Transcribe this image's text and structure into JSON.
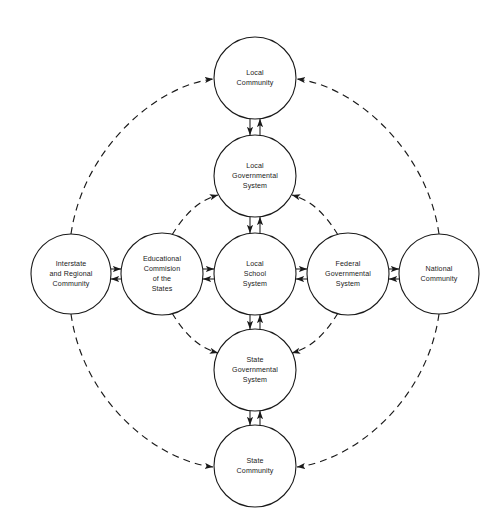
{
  "figure": {
    "type": "node-link-diagram",
    "background_color": "#ffffff",
    "stroke_color": "#1a1a1a",
    "width": 499,
    "height": 530
  },
  "nodes": [
    {
      "id": "local-community",
      "lines": [
        "Local",
        "Community"
      ],
      "cx": 255,
      "cy": 78,
      "r": 41
    },
    {
      "id": "local-governmental-system",
      "lines": [
        "Local",
        "Governmental",
        "System"
      ],
      "cx": 255,
      "cy": 176,
      "r": 41
    },
    {
      "id": "interstate-and-regional-community",
      "lines": [
        "Interstate",
        "and Regional",
        "Community"
      ],
      "cx": 71,
      "cy": 274,
      "r": 40
    },
    {
      "id": "educational-commision-of-the-states",
      "lines": [
        "Educational",
        "Commision",
        "of the",
        "States"
      ],
      "cx": 162,
      "cy": 274,
      "r": 41
    },
    {
      "id": "local-school-system",
      "lines": [
        "Local",
        "School",
        "System"
      ],
      "cx": 255,
      "cy": 274,
      "r": 41
    },
    {
      "id": "federal-governmental-system",
      "lines": [
        "Federal",
        "Governmental",
        "System"
      ],
      "cx": 348,
      "cy": 274,
      "r": 41
    },
    {
      "id": "national-community",
      "lines": [
        "National",
        "Community"
      ],
      "cx": 439,
      "cy": 274,
      "r": 40
    },
    {
      "id": "state-governmental-system",
      "lines": [
        "State",
        "Governmental",
        "System"
      ],
      "cx": 255,
      "cy": 370,
      "r": 41
    },
    {
      "id": "state-community",
      "lines": [
        "State",
        "Community"
      ],
      "cx": 255,
      "cy": 466,
      "r": 41
    }
  ],
  "solid_links": [
    {
      "id": "link-local-community-local-governmental-system",
      "from": "local-community",
      "to": "local-governmental-system",
      "style": "double-arrow-bidirectional",
      "orientation": "vertical"
    },
    {
      "id": "link-local-governmental-system-local-school-system",
      "from": "local-governmental-system",
      "to": "local-school-system",
      "style": "double-arrow-bidirectional",
      "orientation": "vertical"
    },
    {
      "id": "link-local-school-system-state-governmental-system",
      "from": "local-school-system",
      "to": "state-governmental-system",
      "style": "double-arrow-bidirectional",
      "orientation": "vertical"
    },
    {
      "id": "link-state-governmental-system-state-community",
      "from": "state-governmental-system",
      "to": "state-community",
      "style": "double-arrow-bidirectional",
      "orientation": "vertical"
    },
    {
      "id": "link-interstate-educational-commision",
      "from": "interstate-and-regional-community",
      "to": "educational-commision-of-the-states",
      "style": "double-arrow-bidirectional",
      "orientation": "horizontal"
    },
    {
      "id": "link-educational-commision-local-school-system",
      "from": "educational-commision-of-the-states",
      "to": "local-school-system",
      "style": "double-arrow-bidirectional",
      "orientation": "horizontal"
    },
    {
      "id": "link-local-school-system-federal-governmental-system",
      "from": "local-school-system",
      "to": "federal-governmental-system",
      "style": "double-arrow-bidirectional",
      "orientation": "horizontal"
    },
    {
      "id": "link-federal-governmental-system-national-community",
      "from": "federal-governmental-system",
      "to": "national-community",
      "style": "double-arrow-bidirectional",
      "orientation": "horizontal"
    }
  ],
  "dashed_links": [
    {
      "id": "arc-educational-commision-to-local-governmental-system",
      "from": "educational-commision-of-the-states",
      "to": "local-governmental-system",
      "style": "dashed-double-headed-arc"
    },
    {
      "id": "arc-federal-governmental-system-to-local-governmental-system",
      "from": "federal-governmental-system",
      "to": "local-governmental-system",
      "style": "dashed-double-headed-arc"
    },
    {
      "id": "arc-educational-commision-to-state-governmental-system",
      "from": "educational-commision-of-the-states",
      "to": "state-governmental-system",
      "style": "dashed-double-headed-arc"
    },
    {
      "id": "arc-federal-governmental-system-to-state-governmental-system",
      "from": "federal-governmental-system",
      "to": "state-governmental-system",
      "style": "dashed-double-headed-arc"
    },
    {
      "id": "arc-interstate-to-local-community",
      "from": "interstate-and-regional-community",
      "to": "local-community",
      "style": "dashed-double-headed-arc"
    },
    {
      "id": "arc-national-community-to-local-community",
      "from": "national-community",
      "to": "local-community",
      "style": "dashed-double-headed-arc"
    },
    {
      "id": "arc-interstate-to-state-community",
      "from": "interstate-and-regional-community",
      "to": "state-community",
      "style": "dashed-double-headed-arc"
    },
    {
      "id": "arc-national-community-to-state-community",
      "from": "national-community",
      "to": "state-community",
      "style": "dashed-double-headed-arc"
    }
  ]
}
